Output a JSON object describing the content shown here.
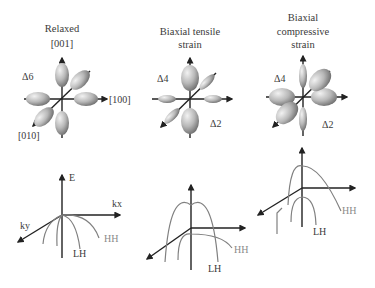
{
  "panels": [
    {
      "title_lines": [
        "Relaxed",
        "[001]"
      ],
      "valley_label": "Δ6",
      "axis_labels": {
        "x": "[100]",
        "y": "[010]"
      }
    },
    {
      "title_lines": [
        "Biaxial tensile",
        "strain"
      ],
      "valley_labels": {
        "in_plane": "Δ4",
        "out_of_plane": "Δ2"
      }
    },
    {
      "title_lines": [
        "Biaxial",
        "compressive",
        "strain"
      ],
      "valley_labels": {
        "in_plane": "Δ4",
        "out_of_plane": "Δ2"
      }
    }
  ],
  "band_diagrams": [
    {
      "axes": {
        "e": "E",
        "kx": "kx",
        "ky": "ky"
      },
      "bands": {
        "hh": "HH",
        "lh": "LH"
      }
    },
    {
      "bands": {
        "hh": "HH",
        "lh": "LH"
      }
    },
    {
      "bands": {
        "hh": "HH",
        "lh": "LH"
      }
    }
  ],
  "colors": {
    "ellipsoid_light": "#e8e8e8",
    "ellipsoid_dark": "#7a7a7a",
    "axis": "#222222",
    "band_curve": "#808080"
  }
}
